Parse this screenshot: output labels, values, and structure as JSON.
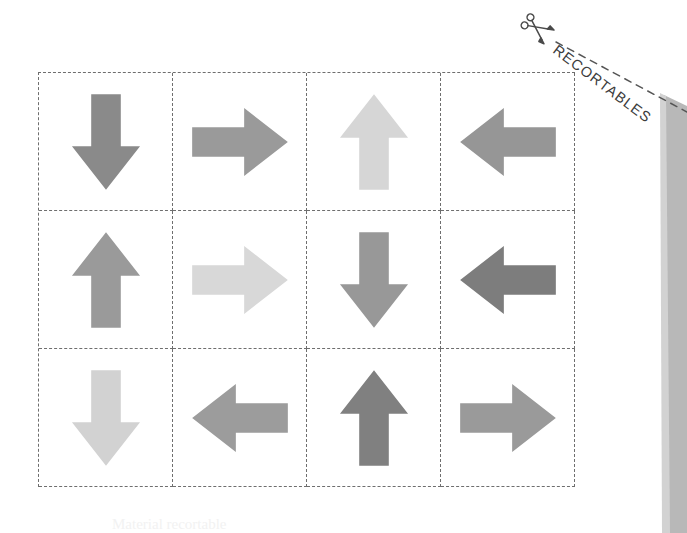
{
  "page": {
    "background_color": "#ffffff",
    "width": 687,
    "height": 533,
    "footer_text": "Material recortable"
  },
  "cut_header": {
    "label": "RECORTABLES",
    "scissors_icon": "scissors-icon",
    "cut_line_style": "dashed",
    "text_color": "#3c3c3c",
    "rotation_degrees": 37
  },
  "page_fold": {
    "name": "page-edge-shadow",
    "color": "#b6b6b6",
    "color_light": "#cfcfcf"
  },
  "grid": {
    "columns": 4,
    "rows": 3,
    "border_style": "dashed",
    "border_color": "#6e6e6e",
    "cells": [
      {
        "id": "r1c1",
        "direction": "down",
        "direction_label": "Abajo",
        "color": "#8a8a8a",
        "icon": "arrow-down-icon"
      },
      {
        "id": "r1c2",
        "direction": "right",
        "direction_label": "Derecha",
        "color": "#9a9a9a",
        "icon": "arrow-right-icon"
      },
      {
        "id": "r1c3",
        "direction": "up",
        "direction_label": "Arriba",
        "color": "#d6d6d6",
        "icon": "arrow-up-icon"
      },
      {
        "id": "r1c4",
        "direction": "left",
        "direction_label": "Izquierda",
        "color": "#969696",
        "icon": "arrow-left-icon"
      },
      {
        "id": "r2c1",
        "direction": "up",
        "direction_label": "Arriba",
        "color": "#9a9a9a",
        "icon": "arrow-up-icon"
      },
      {
        "id": "r2c2",
        "direction": "right",
        "direction_label": "Derecha",
        "color": "#d8d8d8",
        "icon": "arrow-right-icon"
      },
      {
        "id": "r2c3",
        "direction": "down",
        "direction_label": "Abajo",
        "color": "#989898",
        "icon": "arrow-down-icon"
      },
      {
        "id": "r2c4",
        "direction": "left",
        "direction_label": "Izquierda",
        "color": "#7d7d7d",
        "icon": "arrow-left-icon"
      },
      {
        "id": "r3c1",
        "direction": "down",
        "direction_label": "Abajo",
        "color": "#d2d2d2",
        "icon": "arrow-down-icon"
      },
      {
        "id": "r3c2",
        "direction": "left",
        "direction_label": "Izquierda",
        "color": "#9c9c9c",
        "icon": "arrow-left-icon"
      },
      {
        "id": "r3c3",
        "direction": "up",
        "direction_label": "Arriba",
        "color": "#808080",
        "icon": "arrow-up-icon"
      },
      {
        "id": "r3c4",
        "direction": "right",
        "direction_label": "Derecha",
        "color": "#9a9a9a",
        "icon": "arrow-right-icon"
      }
    ]
  }
}
